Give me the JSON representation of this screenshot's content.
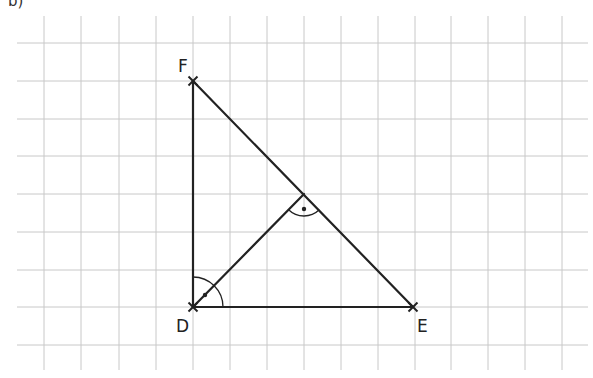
{
  "figure": {
    "part_label": "b)",
    "grid": {
      "vertical_x": [
        44,
        81,
        119,
        156,
        193,
        230,
        267,
        304,
        341,
        378,
        415,
        451,
        488,
        525,
        562
      ],
      "horizontal_y": [
        43,
        81,
        119,
        156,
        194,
        232,
        270,
        307,
        345
      ],
      "x_range": [
        17,
        588
      ],
      "y_range": [
        16,
        370
      ],
      "color": "#c8c8c8"
    },
    "points": {
      "F": {
        "label": "F",
        "x": 193,
        "y": 81,
        "label_x": 178,
        "label_y": 58
      },
      "D": {
        "label": "D",
        "x": 193,
        "y": 307,
        "label_x": 176,
        "label_y": 318
      },
      "E": {
        "label": "E",
        "x": 413,
        "y": 307,
        "label_x": 417,
        "label_y": 318
      },
      "H": {
        "x": 304,
        "y": 194
      }
    },
    "line_color": "#222222"
  }
}
